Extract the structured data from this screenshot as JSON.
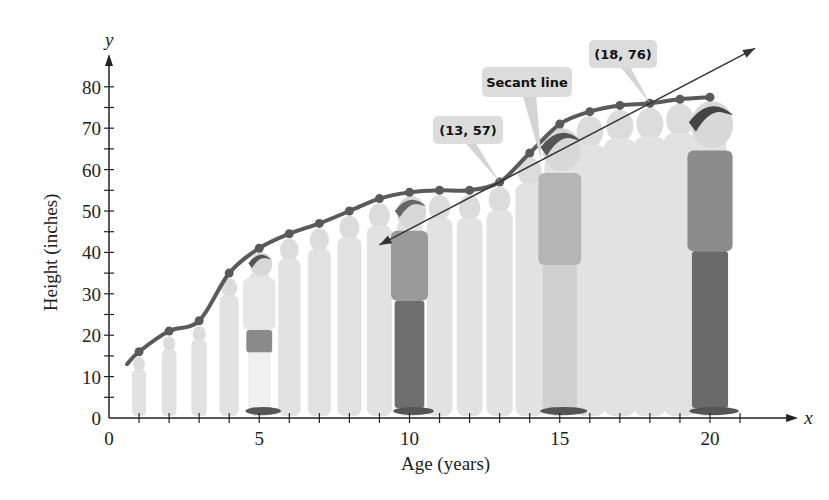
{
  "chart_data": {
    "type": "line",
    "title": "",
    "xlabel": "Age (years)",
    "ylabel": "Height (inches)",
    "x_axis_var": "x",
    "y_axis_var": "y",
    "xlim": [
      0,
      21
    ],
    "ylim": [
      0,
      85
    ],
    "x_ticks": [
      0,
      5,
      10,
      15,
      20
    ],
    "y_ticks": [
      0,
      10,
      20,
      30,
      40,
      50,
      60,
      70,
      80
    ],
    "grid": false,
    "legend": null,
    "series": [
      {
        "name": "Height",
        "color": "#5a5a5a",
        "curve_start": [
          0.6,
          13
        ],
        "x": [
          1,
          2,
          3,
          4,
          5,
          6,
          7,
          8,
          9,
          10,
          11,
          12,
          13,
          14,
          15,
          16,
          17,
          18,
          19,
          20
        ],
        "values": [
          16,
          21,
          23.5,
          35,
          41,
          44.5,
          47,
          50,
          53,
          54.5,
          55,
          55,
          57,
          64,
          71,
          74,
          75.5,
          76,
          77,
          77.5
        ]
      }
    ],
    "secant_line": {
      "label": "Secant line",
      "through": [
        [
          13,
          57
        ],
        [
          18,
          76
        ]
      ],
      "extent_x": [
        9,
        21.5
      ],
      "color": "#333333"
    },
    "annotations": [
      {
        "text": "(13, 57)",
        "point": [
          13,
          57
        ]
      },
      {
        "text": "Secant line",
        "point": [
          14.4,
          62
        ]
      },
      {
        "text": "(18, 76)",
        "point": [
          18,
          76
        ]
      }
    ],
    "background_silhouettes": true
  }
}
